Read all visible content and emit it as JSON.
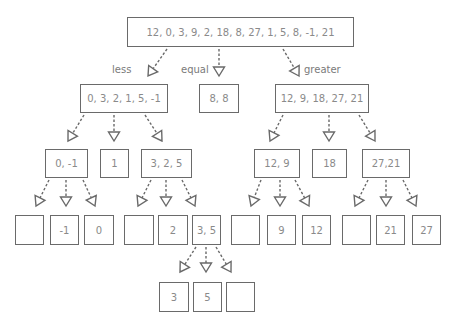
{
  "diagram": {
    "root": {
      "label": "12, 0, 3, 9, 2, 18, 8, 27, 1, 5, 8, -1, 21"
    },
    "partition_labels": {
      "less": "less",
      "equal": "equal",
      "greater": "greater"
    },
    "level1": [
      {
        "id": "less",
        "label": "0, 3, 2, 1, 5, -1"
      },
      {
        "id": "equal",
        "label": "8, 8"
      },
      {
        "id": "greater",
        "label": "12, 9, 18, 27, 21"
      }
    ],
    "level2": [
      {
        "id": "l-less",
        "label": "0, -1"
      },
      {
        "id": "l-equal",
        "label": "1"
      },
      {
        "id": "l-greater",
        "label": "3, 2, 5"
      },
      {
        "id": "g-less",
        "label": "12, 9"
      },
      {
        "id": "g-equal",
        "label": "18"
      },
      {
        "id": "g-greater",
        "label": "27,21"
      }
    ],
    "level3": [
      {
        "id": "ll-less",
        "label": ""
      },
      {
        "id": "ll-equal",
        "label": "-1"
      },
      {
        "id": "ll-greater",
        "label": "0"
      },
      {
        "id": "lg-less",
        "label": ""
      },
      {
        "id": "lg-equal",
        "label": "2"
      },
      {
        "id": "lg-greater",
        "label": "3, 5"
      },
      {
        "id": "gl-less",
        "label": ""
      },
      {
        "id": "gl-equal",
        "label": "9"
      },
      {
        "id": "gl-greater",
        "label": "12"
      },
      {
        "id": "gg-less",
        "label": ""
      },
      {
        "id": "gg-equal",
        "label": "21"
      },
      {
        "id": "gg-greater",
        "label": "27"
      }
    ],
    "level4": [
      {
        "id": "lgg-less",
        "label": "3"
      },
      {
        "id": "lgg-equal",
        "label": "5"
      },
      {
        "id": "lgg-greater",
        "label": ""
      }
    ]
  }
}
